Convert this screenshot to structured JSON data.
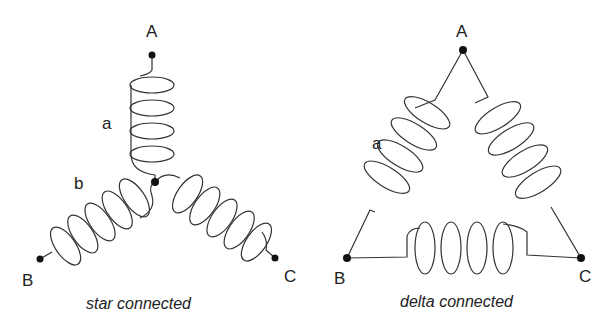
{
  "diagrams": [
    {
      "id": "star",
      "caption": "star connected",
      "terminals": {
        "A": "A",
        "B": "B",
        "C": "C"
      },
      "coil_labels": {
        "a": "a",
        "b": "b"
      }
    },
    {
      "id": "delta",
      "caption": "delta connected",
      "terminals": {
        "A": "A",
        "B": "B",
        "C": "C"
      },
      "coil_labels": {
        "a": "a"
      }
    }
  ]
}
